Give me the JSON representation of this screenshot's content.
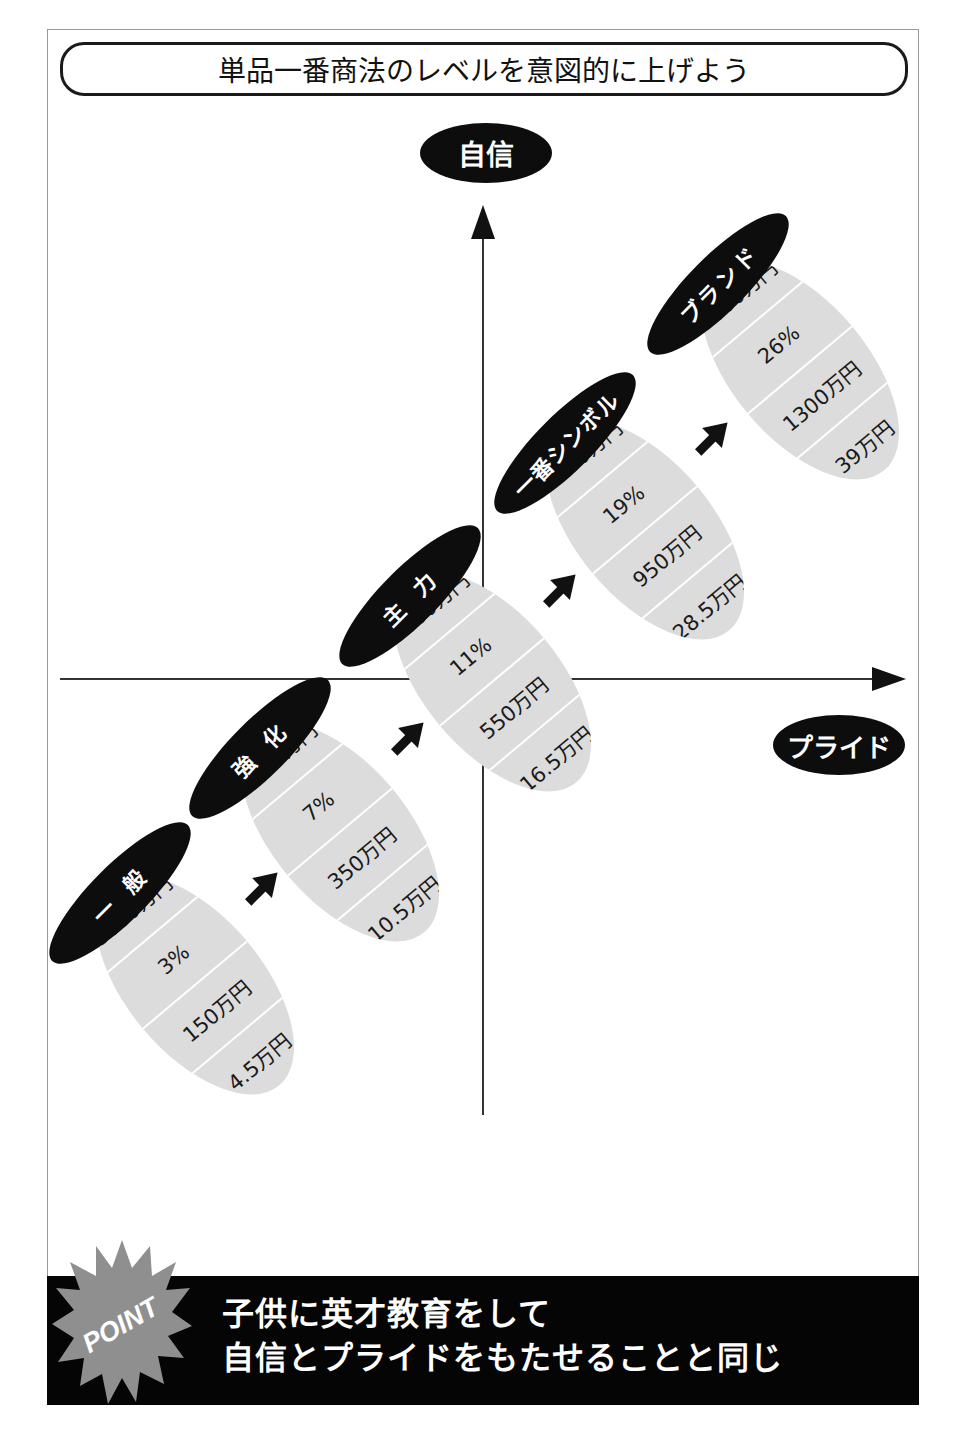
{
  "title": "単品一番商法のレベルを意図的に上げよう",
  "axes": {
    "y_label": "自信",
    "x_label": "プライド"
  },
  "stages": [
    {
      "name": "一 般",
      "rows": [
        "5000万円",
        "3%",
        "150万円",
        "4.5万円"
      ]
    },
    {
      "name": "強 化",
      "rows": [
        "5000万円",
        "7%",
        "350万円",
        "10.5万円"
      ]
    },
    {
      "name": "主 力",
      "rows": [
        "5000万円",
        "11%",
        "550万円",
        "16.5万円"
      ]
    },
    {
      "name": "一番シンボル",
      "rows": [
        "5000万円",
        "19%",
        "950万円",
        "28.5万円"
      ]
    },
    {
      "name": "ブランド",
      "rows": [
        "5000万円",
        "26%",
        "1300万円",
        "39万円"
      ]
    }
  ],
  "point": {
    "badge": "POINT",
    "line1": "子供に英才教育をして",
    "line2": "自信とプライドをもたせることと同じ"
  },
  "colors": {
    "label_bg": "#0d0d0d",
    "stage_fill": "#dcdcdc",
    "badge_fill": "#8f8f8f",
    "band_bg": "#050505"
  }
}
